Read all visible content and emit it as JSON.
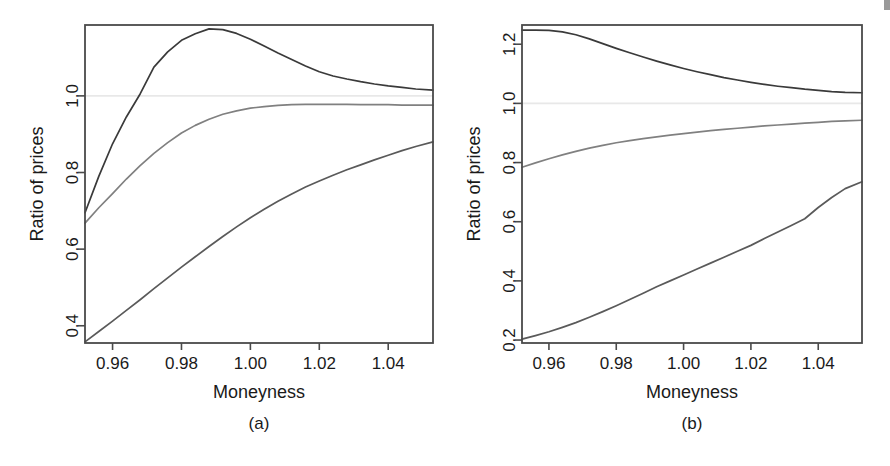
{
  "figure": {
    "background_color": "#ffffff",
    "panels": [
      {
        "id": "a",
        "caption": "(a)",
        "xlabel": "Moneyness",
        "ylabel": "Ratio of prices",
        "xticks": [
          "0.96",
          "0.98",
          "1.00",
          "1.02",
          "1.04"
        ],
        "yticks": [
          "0.4",
          "0.6",
          "0.8",
          "1.0"
        ]
      },
      {
        "id": "b",
        "caption": "(b)",
        "xlabel": "Moneyness",
        "ylabel": "Ratio of prices",
        "xticks": [
          "0.96",
          "0.98",
          "1.00",
          "1.02",
          "1.04"
        ],
        "yticks": [
          "0.2",
          "0.4",
          "0.6",
          "0.8",
          "1.0",
          "1.2"
        ]
      }
    ]
  },
  "chart_data": [
    {
      "type": "line",
      "panel": "a",
      "title": "",
      "xlabel": "Moneyness",
      "ylabel": "Ratio of prices",
      "xlim": [
        0.952,
        1.053
      ],
      "ylim": [
        0.355,
        1.185
      ],
      "xticks": [
        0.96,
        0.98,
        1.0,
        1.02,
        1.04
      ],
      "yticks": [
        0.4,
        0.6,
        0.8,
        1.0
      ],
      "grid": false,
      "reference_line": {
        "y": 1.0,
        "color": "#e8e8e8",
        "style": "solid"
      },
      "legend": "none",
      "x": [
        0.952,
        0.956,
        0.96,
        0.964,
        0.968,
        0.972,
        0.976,
        0.98,
        0.984,
        0.988,
        0.992,
        0.996,
        1.0,
        1.004,
        1.008,
        1.012,
        1.016,
        1.02,
        1.024,
        1.028,
        1.032,
        1.036,
        1.04,
        1.044,
        1.048,
        1.053
      ],
      "series": [
        {
          "name": "upper-curve",
          "color": "#3a3a3a",
          "values": [
            0.695,
            0.79,
            0.875,
            0.945,
            1.005,
            1.075,
            1.115,
            1.145,
            1.162,
            1.175,
            1.173,
            1.163,
            1.148,
            1.13,
            1.112,
            1.095,
            1.078,
            1.063,
            1.052,
            1.044,
            1.037,
            1.031,
            1.026,
            1.022,
            1.018,
            1.015
          ]
        },
        {
          "name": "middle-curve",
          "color": "#808080",
          "values": [
            0.668,
            0.708,
            0.745,
            0.783,
            0.818,
            0.85,
            0.878,
            0.903,
            0.923,
            0.939,
            0.952,
            0.961,
            0.968,
            0.972,
            0.975,
            0.977,
            0.978,
            0.978,
            0.978,
            0.978,
            0.977,
            0.977,
            0.977,
            0.976,
            0.976,
            0.976
          ]
        },
        {
          "name": "lower-curve",
          "color": "#5a5a5a",
          "values": [
            0.358,
            0.385,
            0.412,
            0.44,
            0.468,
            0.497,
            0.525,
            0.553,
            0.58,
            0.607,
            0.633,
            0.658,
            0.682,
            0.704,
            0.725,
            0.744,
            0.762,
            0.778,
            0.793,
            0.807,
            0.82,
            0.833,
            0.845,
            0.857,
            0.868,
            0.88
          ]
        }
      ]
    },
    {
      "type": "line",
      "panel": "b",
      "title": "",
      "xlabel": "Moneyness",
      "ylabel": "Ratio of prices",
      "xlim": [
        0.952,
        1.053
      ],
      "ylim": [
        0.19,
        1.265
      ],
      "xticks": [
        0.96,
        0.98,
        1.0,
        1.02,
        1.04
      ],
      "yticks": [
        0.2,
        0.4,
        0.6,
        0.8,
        1.0,
        1.2
      ],
      "grid": false,
      "reference_line": {
        "y": 1.0,
        "color": "#e8e8e8",
        "style": "solid"
      },
      "legend": "none",
      "x": [
        0.952,
        0.956,
        0.96,
        0.964,
        0.968,
        0.972,
        0.976,
        0.98,
        0.984,
        0.988,
        0.992,
        0.996,
        1.0,
        1.004,
        1.008,
        1.012,
        1.016,
        1.02,
        1.024,
        1.028,
        1.032,
        1.036,
        1.04,
        1.044,
        1.048,
        1.053
      ],
      "series": [
        {
          "name": "upper-curve",
          "color": "#3a3a3a",
          "values": [
            1.248,
            1.248,
            1.247,
            1.242,
            1.232,
            1.218,
            1.202,
            1.186,
            1.171,
            1.157,
            1.143,
            1.13,
            1.118,
            1.107,
            1.097,
            1.087,
            1.079,
            1.071,
            1.064,
            1.058,
            1.053,
            1.048,
            1.044,
            1.04,
            1.037,
            1.036
          ]
        },
        {
          "name": "middle-curve",
          "color": "#808080",
          "values": [
            0.784,
            0.799,
            0.813,
            0.826,
            0.838,
            0.849,
            0.858,
            0.867,
            0.874,
            0.881,
            0.887,
            0.893,
            0.898,
            0.903,
            0.908,
            0.912,
            0.916,
            0.92,
            0.924,
            0.927,
            0.93,
            0.933,
            0.936,
            0.939,
            0.941,
            0.943
          ]
        },
        {
          "name": "lower-curve",
          "color": "#5a5a5a",
          "values": [
            0.203,
            0.215,
            0.228,
            0.243,
            0.259,
            0.277,
            0.296,
            0.316,
            0.337,
            0.358,
            0.38,
            0.4,
            0.42,
            0.44,
            0.46,
            0.48,
            0.5,
            0.52,
            0.543,
            0.565,
            0.587,
            0.61,
            0.648,
            0.682,
            0.712,
            0.735
          ]
        }
      ]
    }
  ]
}
